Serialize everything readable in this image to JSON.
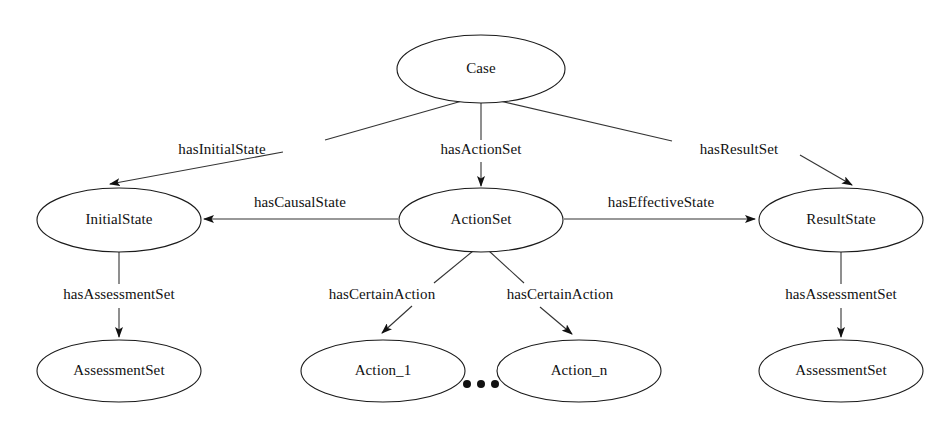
{
  "diagram": {
    "background_color": "#ffffff",
    "stroke_color": "#333333",
    "text_color": "#111111",
    "nodes": [
      {
        "id": "case",
        "label": "Case",
        "cx": 481,
        "cy": 69,
        "rx": 84,
        "ry": 34
      },
      {
        "id": "initial_state",
        "label": "InitialState",
        "cx": 119,
        "cy": 220,
        "rx": 82,
        "ry": 32
      },
      {
        "id": "action_set",
        "label": "ActionSet",
        "cx": 481,
        "cy": 220,
        "rx": 82,
        "ry": 32
      },
      {
        "id": "result_state",
        "label": "ResultState",
        "cx": 841,
        "cy": 220,
        "rx": 82,
        "ry": 32
      },
      {
        "id": "assessment_set_left",
        "label": "AssessmentSet",
        "cx": 119,
        "cy": 371,
        "rx": 82,
        "ry": 31
      },
      {
        "id": "action_1",
        "label": "Action_1",
        "cx": 383,
        "cy": 371,
        "rx": 82,
        "ry": 31
      },
      {
        "id": "action_n",
        "label": "Action_n",
        "cx": 579,
        "cy": 371,
        "rx": 82,
        "ry": 31
      },
      {
        "id": "assessment_set_right",
        "label": "AssessmentSet",
        "cx": 841,
        "cy": 371,
        "rx": 82,
        "ry": 31
      }
    ],
    "edges": [
      {
        "id": "e_has_initial_state",
        "label": "hasInitialState",
        "from": "case",
        "to": "initial_state",
        "label_x": 222,
        "label_y": 151
      },
      {
        "id": "e_has_action_set",
        "label": "hasActionSet",
        "from": "case",
        "to": "action_set",
        "label_x": 481,
        "label_y": 151
      },
      {
        "id": "e_has_result_set",
        "label": "hasResultSet",
        "from": "case",
        "to": "result_state",
        "label_x": 739,
        "label_y": 151
      },
      {
        "id": "e_has_causal_state",
        "label": "hasCausalState",
        "from": "action_set",
        "to": "initial_state",
        "label_x": 300,
        "label_y": 204
      },
      {
        "id": "e_has_effective_state",
        "label": "hasEffectiveState",
        "from": "action_set",
        "to": "result_state",
        "label_x": 661,
        "label_y": 204
      },
      {
        "id": "e_has_assessment_set_left",
        "label": "hasAssessmentSet",
        "from": "initial_state",
        "to": "assessment_set_left",
        "label_x": 119,
        "label_y": 296
      },
      {
        "id": "e_has_certain_action_1",
        "label": "hasCertainAction",
        "from": "action_set",
        "to": "action_1",
        "label_x": 382,
        "label_y": 296
      },
      {
        "id": "e_has_certain_action_n",
        "label": "hasCertainAction",
        "from": "action_set",
        "to": "action_n",
        "label_x": 560,
        "label_y": 296
      },
      {
        "id": "e_has_assessment_set_right",
        "label": "hasAssessmentSet",
        "from": "result_state",
        "to": "assessment_set_right",
        "label_x": 841,
        "label_y": 296
      }
    ],
    "ellipsis": {
      "label": "...",
      "dots": [
        {
          "cx": 467,
          "cy": 384,
          "r": 4
        },
        {
          "cx": 481,
          "cy": 384,
          "r": 4
        },
        {
          "cx": 495,
          "cy": 384,
          "r": 4
        }
      ]
    }
  }
}
